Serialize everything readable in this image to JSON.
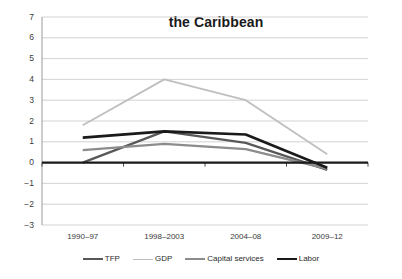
{
  "chart_data": {
    "type": "line",
    "title": "the Caribbean",
    "xlabel": "",
    "ylabel": "",
    "categories": [
      "1990–97",
      "1998–2003",
      "2004–08",
      "2009–12"
    ],
    "ylim": [
      -3,
      7
    ],
    "yticks": [
      7,
      6,
      5,
      4,
      3,
      2,
      1,
      0,
      -1,
      -2,
      -3
    ],
    "ytick_labels": [
      "7",
      "6",
      "5",
      "4",
      "3",
      "2",
      "1",
      "0",
      "−1",
      "−2",
      "−3"
    ],
    "grid": true,
    "grid_axis": "y",
    "legend_position": "bottom",
    "series": [
      {
        "name": "TFP",
        "color": "#585858",
        "width": 2.2,
        "values": [
          0.0,
          1.5,
          0.95,
          -0.35
        ]
      },
      {
        "name": "GDP",
        "color": "#bfbfbf",
        "width": 1.8,
        "values": [
          1.8,
          4.0,
          3.0,
          0.4
        ]
      },
      {
        "name": "Capital services",
        "color": "#8c8c8c",
        "width": 2.2,
        "values": [
          0.6,
          0.9,
          0.65,
          -0.3
        ]
      },
      {
        "name": "Labor",
        "color": "#1a1a1a",
        "width": 2.6,
        "values": [
          1.2,
          1.5,
          1.35,
          -0.25
        ]
      }
    ]
  },
  "axis": {
    "zero_line_label": "0",
    "zero_line_color": "#1a1a1a",
    "gridline_color": "#c8c8c8",
    "axis_line_color": "#9a9a9a"
  },
  "legend": {
    "items": [
      {
        "label": "TFP",
        "color": "#585858"
      },
      {
        "label": "GDP",
        "color": "#bfbfbf"
      },
      {
        "label": "Capital services",
        "color": "#8c8c8c"
      },
      {
        "label": "Labor",
        "color": "#1a1a1a"
      }
    ]
  }
}
